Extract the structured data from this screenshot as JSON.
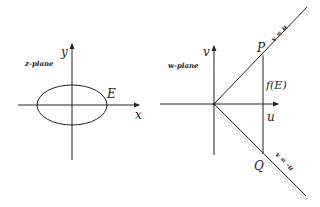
{
  "figure": {
    "left_panel": {
      "plane_label": "z-plane",
      "x_axis_label": "x",
      "y_axis_label": "y",
      "curve_label": "E",
      "curve_shape": "ellipse"
    },
    "right_panel": {
      "plane_label": "w-plane",
      "u_axis_label": "u",
      "v_axis_label": "v",
      "upper_line_label": "v = u",
      "lower_line_label": "v = -u",
      "point_top_label": "P",
      "point_bottom_label": "Q",
      "image_label": "f(E)"
    },
    "colors": {
      "stroke": "#222222",
      "background": "#ffffff"
    }
  }
}
